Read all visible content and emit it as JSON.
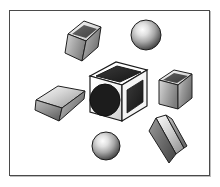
{
  "scene": {
    "title": "3D grayscale shapes scene",
    "canvas": {
      "width": 220,
      "height": 187,
      "background_color": "#ffffff"
    },
    "frame": {
      "border_color": "#4a4a4a",
      "shadow_color": "#bdbdbd",
      "x": 9,
      "y": 10,
      "width": 201,
      "height": 166
    },
    "palette": {
      "outline": "#1a1a1a",
      "hole_fill": "#1c1c1c",
      "face_light": "#fefefe",
      "face_mid": "#b9b9b9",
      "face_dark": "#6f6f6f",
      "sphere_highlight": "#f2f2f2",
      "sphere_shadow": "#3a3a3a"
    },
    "object_count": 7,
    "objects": [
      {
        "id": "center-open-cube",
        "label": "Open cube with circular hole",
        "type": "cube",
        "center_x": 118,
        "center_y": 93,
        "size": 58,
        "has_hole": true,
        "hole_color": "#1c1c1c"
      },
      {
        "id": "top-left-cube",
        "label": "Tilted cube upper left",
        "type": "cube",
        "center_x": 81,
        "center_y": 38,
        "size": 36,
        "rotation": -18
      },
      {
        "id": "top-sphere",
        "label": "Shaded sphere upper right",
        "type": "sphere",
        "center_x": 146,
        "center_y": 35,
        "radius": 15
      },
      {
        "id": "left-slab",
        "label": "Tilted flat slab left",
        "type": "box",
        "center_x": 58,
        "center_y": 100,
        "rotation": -20
      },
      {
        "id": "right-cube",
        "label": "Open cube right",
        "type": "cube",
        "center_x": 174,
        "center_y": 90,
        "size": 30
      },
      {
        "id": "bottom-sphere",
        "label": "Shaded sphere lower left",
        "type": "sphere",
        "center_x": 106,
        "center_y": 146,
        "radius": 14
      },
      {
        "id": "bottom-right-prism",
        "label": "Tilted elongated prism lower right",
        "type": "prism",
        "center_x": 166,
        "center_y": 140,
        "rotation": 35
      }
    ]
  }
}
